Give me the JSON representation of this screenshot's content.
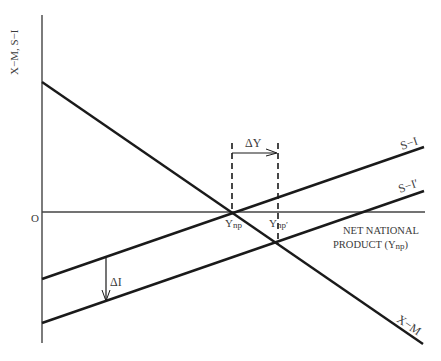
{
  "diagram": {
    "title": "",
    "y_axis_label": "X−M, S−I",
    "x_axis_label_line1": "NET NATIONAL",
    "x_axis_label_line2": "PRODUCT (Y",
    "x_axis_label_sub": "np",
    "x_axis_label_close": ")",
    "origin_label": "O",
    "curves": {
      "x_minus_m": "X−M",
      "s_minus_i": "S−I",
      "s_minus_i_prime": "S−I′"
    },
    "points": {
      "ynp": "Y",
      "ynp_sub": "np",
      "ynp_prime": "Y",
      "ynp_prime_sub": "np′"
    },
    "annotations": {
      "delta_y": "ΔY",
      "delta_i": "ΔI"
    },
    "colors": {
      "line": "#1a1a1a",
      "axis": "#444444",
      "text": "#3a3a3a"
    }
  }
}
